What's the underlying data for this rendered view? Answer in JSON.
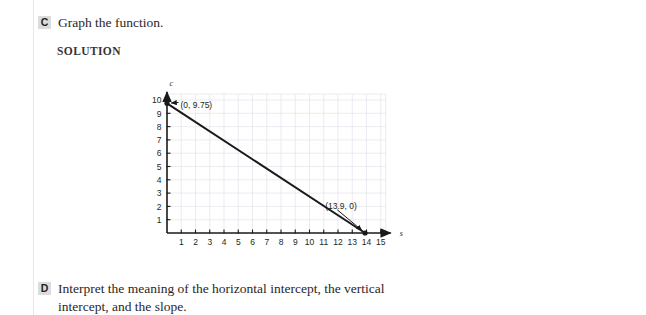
{
  "page": {
    "background": "#ffffff",
    "badge_bg": "#dcdcdc",
    "text_color": "#231f20"
  },
  "parts": [
    {
      "letter": "C",
      "text": "Graph the function."
    },
    {
      "letter": "D",
      "text": "Interpret the meaning of the horizontal intercept, the vertical intercept, and the slope."
    }
  ],
  "solution_heading": "SOLUTION",
  "chart_data": {
    "type": "line",
    "title": "",
    "xlabel": "s",
    "ylabel": "c",
    "xlim": [
      0,
      15.7
    ],
    "ylim": [
      0,
      10.6
    ],
    "grid": true,
    "grid_color": "#e3e3ec",
    "axis_color": "#1a1a1a",
    "line_color": "#1a1a1a",
    "x_ticks": [
      1,
      2,
      3,
      4,
      5,
      6,
      7,
      8,
      9,
      10,
      11,
      12,
      13,
      14,
      15
    ],
    "x_tick_labels": [
      "1",
      "2",
      "3",
      "4",
      "5",
      "6",
      "7",
      "8",
      "9",
      "10",
      "11",
      "12",
      "13",
      "14",
      "15"
    ],
    "y_ticks": [
      1,
      2,
      3,
      4,
      5,
      6,
      7,
      8,
      9,
      10
    ],
    "y_tick_labels": [
      "1",
      "2",
      "3",
      "4",
      "5",
      "6",
      "7",
      "8",
      "9",
      "10"
    ],
    "series": [
      {
        "name": "c(s)",
        "points": [
          [
            0,
            9.75
          ],
          [
            13.9,
            0
          ]
        ]
      }
    ],
    "annotations": [
      {
        "text": "(0, 9.75)",
        "point": [
          0,
          9.75
        ],
        "label_at": [
          0.95,
          9.62
        ]
      },
      {
        "text": "(13.9, 0)",
        "point": [
          13.9,
          0
        ],
        "label_at": [
          11.1,
          2.05
        ]
      }
    ]
  }
}
